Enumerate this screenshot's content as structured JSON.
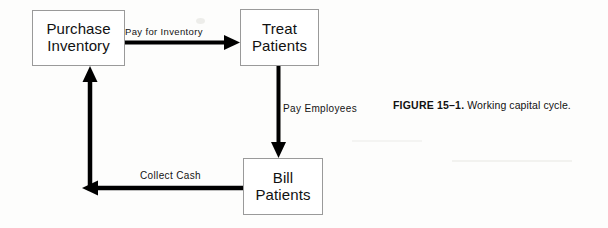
{
  "figure": {
    "caption_label": "FIGURE 15–1.",
    "caption_text": "Working capital cycle."
  },
  "diagram": {
    "title": "Working capital cycle",
    "nodes": [
      {
        "id": "purchase-inventory",
        "line1": "Purchase",
        "line2": "Inventory"
      },
      {
        "id": "treat-patients",
        "line1": "Treat",
        "line2": "Patients"
      },
      {
        "id": "bill-patients",
        "line1": "Bill",
        "line2": "Patients"
      }
    ],
    "edges": [
      {
        "id": "pay-for-inventory",
        "label": "Pay for Inventory",
        "from": "purchase-inventory",
        "to": "treat-patients",
        "direction": "right"
      },
      {
        "id": "pay-employees",
        "label": "Pay Employees",
        "from": "treat-patients",
        "to": "bill-patients",
        "direction": "down"
      },
      {
        "id": "collect-cash",
        "label": "Collect Cash",
        "from": "bill-patients",
        "to": "purchase-inventory",
        "direction": "left-up"
      }
    ],
    "colors": {
      "stroke": "#000000",
      "box_border": "#9a9a9a",
      "text": "#111111",
      "background": "#fdfdfc"
    }
  }
}
